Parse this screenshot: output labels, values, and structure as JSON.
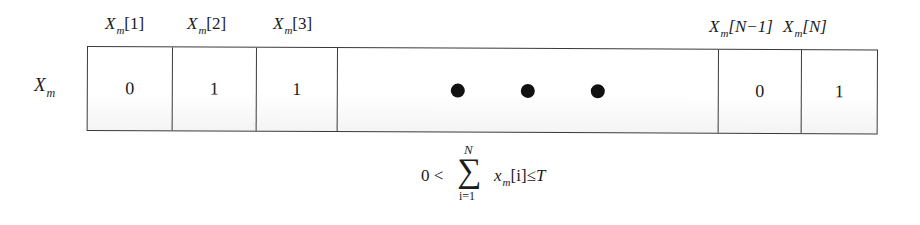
{
  "diagram": {
    "row_label": {
      "base": "X",
      "sub": "m"
    },
    "index_labels": [
      {
        "base": "X",
        "sub": "m",
        "index": "[1]"
      },
      {
        "base": "X",
        "sub": "m",
        "index": "[2]"
      },
      {
        "base": "X",
        "sub": "m",
        "index": "[3]"
      },
      {
        "base": "X",
        "sub": "m",
        "index": "[N−1]"
      },
      {
        "base": "X",
        "sub": "m",
        "index": "[N]"
      }
    ],
    "cells": [
      {
        "value": "0"
      },
      {
        "value": "1"
      },
      {
        "value": "1"
      },
      {
        "value": "ellipsis",
        "dots": 3
      },
      {
        "value": "0"
      },
      {
        "value": "1"
      }
    ],
    "constraint": {
      "lhs": "0 <",
      "sum_symbol": "∑",
      "upper_limit": "N",
      "lower_limit": "i=1",
      "term_base": "x",
      "term_sub": "m",
      "term_index": "[i]",
      "relation": "≤",
      "rhs": "T"
    },
    "colors": {
      "line": "#3a3a3a",
      "text": "#1c1c1c",
      "dot": "#111111",
      "background": "#ffffff"
    }
  }
}
